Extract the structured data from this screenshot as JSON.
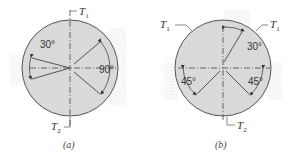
{
  "figure": {
    "panels": [
      {
        "id": "a",
        "caption": "(a)",
        "torque_top": {
          "symbol": "T",
          "subscript": "1"
        },
        "torque_bottom": {
          "symbol": "T",
          "subscript": "2"
        },
        "angles": [
          {
            "label": "30°",
            "position": "left"
          },
          {
            "label": "90°",
            "position": "right"
          }
        ]
      },
      {
        "id": "b",
        "caption": "(b)",
        "torque_left": {
          "symbol": "T",
          "subscript": "1"
        },
        "torque_right": {
          "symbol": "T",
          "subscript": "1"
        },
        "torque_bottom": {
          "symbol": "T",
          "subscript": "2"
        },
        "angles": [
          {
            "label": "30°",
            "position": "top-right"
          },
          {
            "label": "45°",
            "position": "left"
          },
          {
            "label": "45°",
            "position": "right"
          }
        ]
      }
    ],
    "colors": {
      "disk_fill": "#d9d9d9",
      "line": "#444444",
      "stipple": "#b8b8b8"
    }
  }
}
